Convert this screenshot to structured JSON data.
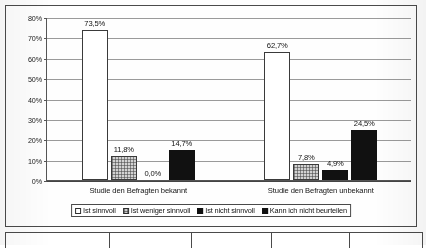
{
  "chart_data": {
    "type": "bar",
    "title": "",
    "subtitle": "",
    "xlabel": "",
    "ylabel": "",
    "ylim": [
      0,
      80
    ],
    "ytick_labels": [
      "0%",
      "10%",
      "20%",
      "30%",
      "40%",
      "50%",
      "60%",
      "70%",
      "80%"
    ],
    "ytick_values": [
      0,
      10,
      20,
      30,
      40,
      50,
      60,
      70,
      80
    ],
    "grid": true,
    "legend_position": "bottom",
    "categories": [
      "Studie den Befragten bekannt",
      "Studie den Befragten unbekannt"
    ],
    "series": [
      {
        "name": "Ist sinnvoll",
        "values": [
          73.5,
          62.7
        ],
        "labels": [
          "73,5%",
          "62,7%"
        ],
        "fill": "white-outline"
      },
      {
        "name": "Ist weniger sinnvoll",
        "values": [
          11.8,
          7.8
        ],
        "labels": [
          "11,8%",
          "7,8%"
        ],
        "fill": "gray-hatched"
      },
      {
        "name": "Ist nicht sinnvoll",
        "values": [
          0.0,
          4.9
        ],
        "labels": [
          "0,0%",
          "4,9%"
        ],
        "fill": "black"
      },
      {
        "name": "Kann ich nicht beurteilen",
        "values": [
          14.7,
          24.5
        ],
        "labels": [
          "14,7%",
          "24,5%"
        ],
        "fill": "black"
      }
    ]
  },
  "legend": {
    "items": [
      {
        "label": "Ist sinnvoll"
      },
      {
        "label": "Ist weniger sinnvoll"
      },
      {
        "label": "Ist nicht sinnvoll"
      },
      {
        "label": "Kann ich nicht beurteilen"
      }
    ]
  },
  "bottom_table": {
    "cells": [
      "",
      "",
      "",
      "",
      ""
    ]
  },
  "colors": {
    "series_white": "#ffffff",
    "series_hatched": "#d2d2d2",
    "series_black": "#111111",
    "axis": "#555555",
    "gridline": "#9a9a9a",
    "frame": "#4a4a4a",
    "page_background": "#fdfdfd"
  }
}
